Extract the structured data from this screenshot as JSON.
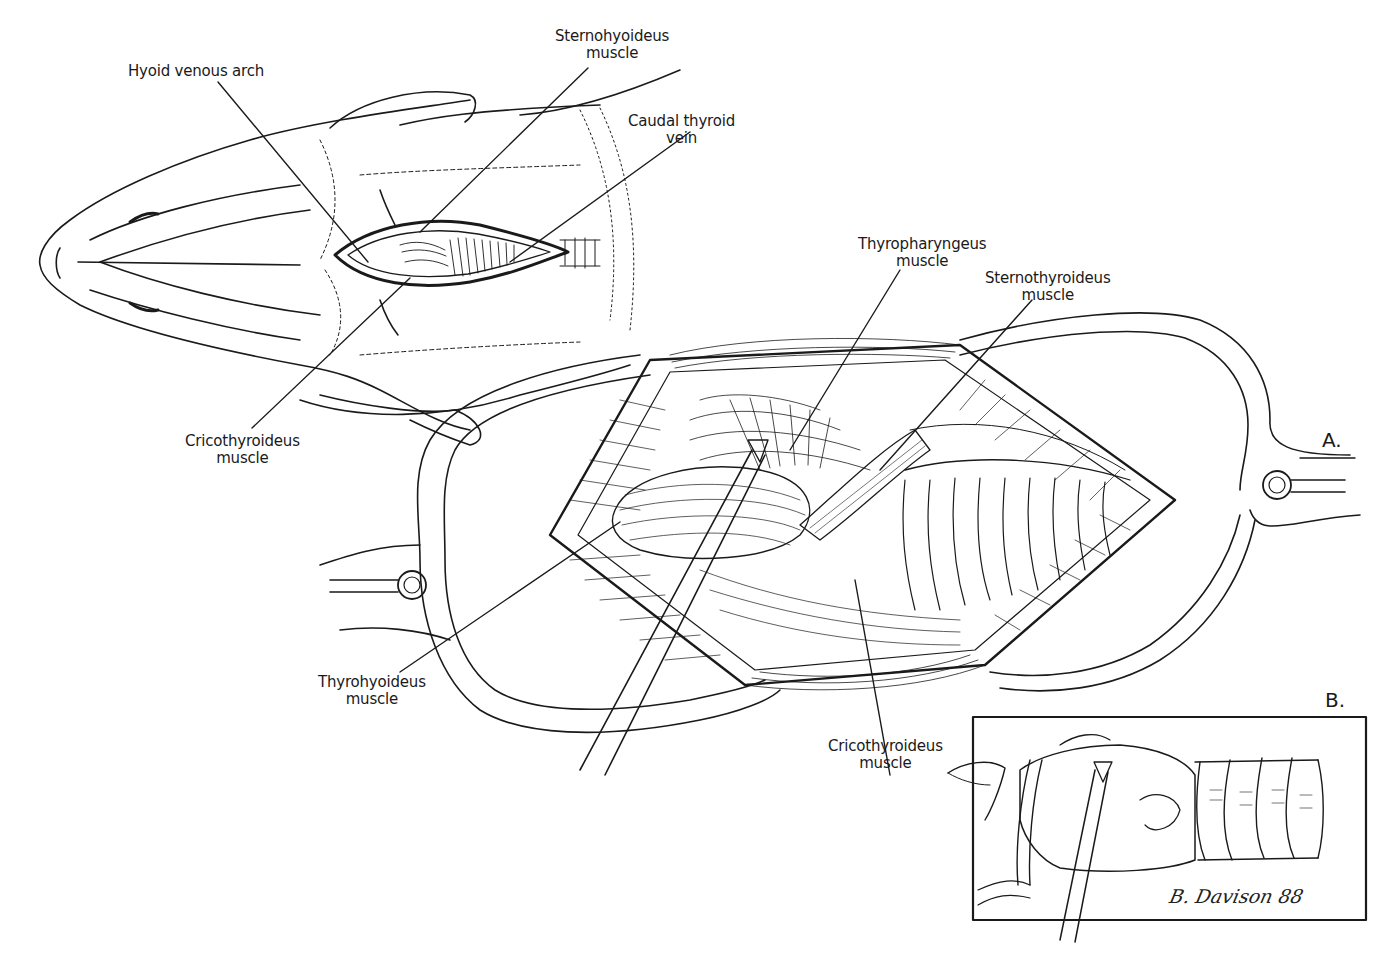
{
  "figure": {
    "type": "anatomical-illustration",
    "panels": [
      {
        "id": "A",
        "letter": "A."
      },
      {
        "id": "B",
        "letter": "B."
      }
    ],
    "signature": "B. Davison 88",
    "colors": {
      "ink": "#1a1a1a",
      "paper": "#ffffff"
    }
  },
  "labels": {
    "hyoid_venous_arch": {
      "line1": "Hyoid venous arch",
      "line2": ""
    },
    "sternohyoideus": {
      "line1": "Sternohyoideus",
      "line2": "muscle"
    },
    "caudal_thyroid_vein": {
      "line1": "Caudal thyroid",
      "line2": "vein"
    },
    "cricothyroideus_upper": {
      "line1": "Cricothyroideus",
      "line2": "muscle"
    },
    "thyropharyngeus": {
      "line1": "Thyropharyngeus",
      "line2": "muscle"
    },
    "sternothyroideus": {
      "line1": "Sternothyroideus",
      "line2": "muscle"
    },
    "thyrohyoideus": {
      "line1": "Thyrohyoideus",
      "line2": "muscle"
    },
    "cricothyroideus_lower": {
      "line1": "Cricothyroideus",
      "line2": "muscle"
    }
  }
}
